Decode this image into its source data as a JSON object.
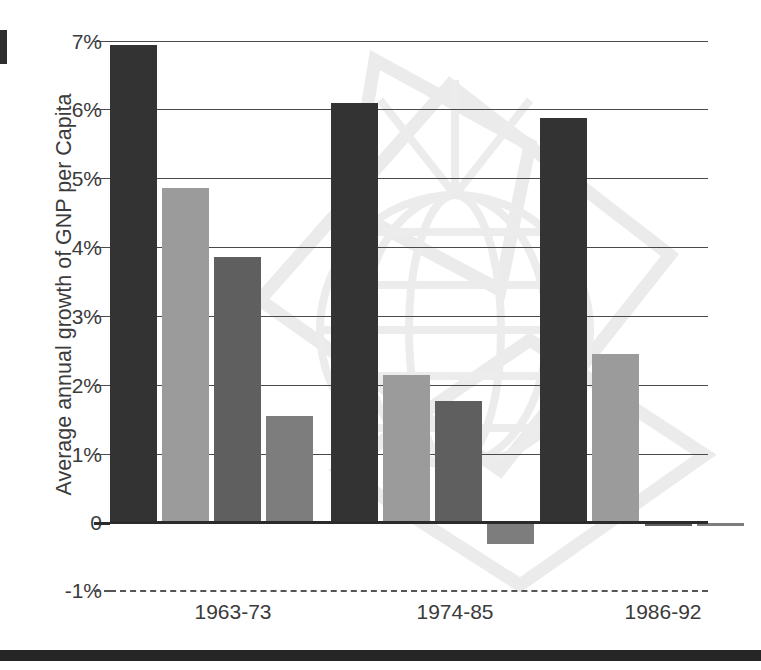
{
  "chart_data": {
    "type": "bar",
    "title": "",
    "subtitle": "",
    "xlabel": "",
    "ylabel": "Average annual growth of GNP per Capita",
    "categories": [
      "1963-73",
      "1974-85",
      "1986-92"
    ],
    "yticks": [
      "7%",
      "6%",
      "5%",
      "4%",
      "3%",
      "2%",
      "1%",
      "0",
      "-1%"
    ],
    "ytick_values": [
      7,
      6,
      5,
      4,
      3,
      2,
      1,
      0,
      -1
    ],
    "ylim": [
      -1,
      7
    ],
    "grid": true,
    "legend": "none",
    "series": [
      {
        "name": "series-1",
        "color": "#333333",
        "values": [
          6.95,
          6.1,
          5.88
        ]
      },
      {
        "name": "series-2",
        "color": "#9b9b9b",
        "values": [
          4.87,
          2.15,
          2.45
        ]
      },
      {
        "name": "series-3",
        "color": "#5f5f5f",
        "values": [
          3.87,
          1.78,
          -0.05
        ]
      },
      {
        "name": "series-4",
        "color": "#7d7d7d",
        "values": [
          1.55,
          -0.3,
          -0.05
        ]
      }
    ],
    "bars": [
      {
        "group": "1963-73",
        "series": "series-1",
        "value": 6.95,
        "color": "#333333",
        "x": 110,
        "width": 47
      },
      {
        "group": "1963-73",
        "series": "series-2",
        "value": 4.87,
        "color": "#9b9b9b",
        "x": 162,
        "width": 47
      },
      {
        "group": "1963-73",
        "series": "series-3",
        "value": 3.87,
        "color": "#5f5f5f",
        "x": 214,
        "width": 47
      },
      {
        "group": "1963-73",
        "series": "series-4",
        "value": 1.55,
        "color": "#7d7d7d",
        "x": 266,
        "width": 47
      },
      {
        "group": "1974-85",
        "series": "series-1",
        "value": 6.1,
        "color": "#333333",
        "x": 331,
        "width": 47
      },
      {
        "group": "1974-85",
        "series": "series-2",
        "value": 2.15,
        "color": "#9b9b9b",
        "x": 383,
        "width": 47
      },
      {
        "group": "1974-85",
        "series": "series-3",
        "value": 1.78,
        "color": "#5f5f5f",
        "x": 435,
        "width": 47
      },
      {
        "group": "1974-85",
        "series": "series-4",
        "value": -0.3,
        "color": "#7d7d7d",
        "x": 487,
        "width": 47
      },
      {
        "group": "1986-92",
        "series": "series-1",
        "value": 5.88,
        "color": "#333333",
        "x": 540,
        "width": 47
      },
      {
        "group": "1986-92",
        "series": "series-2",
        "value": 2.45,
        "color": "#9b9b9b",
        "x": 592,
        "width": 47
      },
      {
        "group": "1986-92",
        "series": "series-3",
        "value": -0.05,
        "color": "#5f5f5f",
        "x": 645,
        "width": 47
      },
      {
        "group": "1986-92",
        "series": "series-4",
        "value": -0.05,
        "color": "#7d7d7d",
        "x": 697,
        "width": 47
      }
    ],
    "group_label_centers": [
      233,
      455,
      663
    ],
    "colors": {
      "gridline": "#4a4a4a",
      "zero_line": "#2b2b2b",
      "text": "#3b3b3b",
      "background": "#ffffff",
      "watermark": "#ececec",
      "bottom_rule": "#262626"
    },
    "geometry": {
      "plot_left": 110,
      "plot_right": 708,
      "y_top_px": 41,
      "y_zero_px": 523,
      "px_per_percent": 68.8,
      "neg_dash_px": 590
    }
  }
}
